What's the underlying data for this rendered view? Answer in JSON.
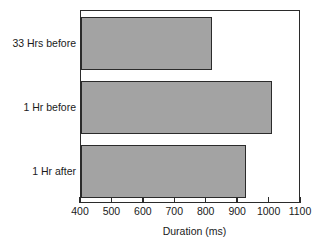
{
  "chart_data": {
    "type": "bar",
    "orientation": "horizontal",
    "title": "",
    "xlabel": "Duration (ms)",
    "ylabel": "",
    "categories": [
      "33 Hrs before",
      "1 Hr before",
      "1 Hr after"
    ],
    "values": [
      817,
      1008,
      925
    ],
    "xlim": [
      400,
      1100
    ],
    "xticks": [
      400,
      500,
      600,
      700,
      800,
      900,
      1000,
      1100
    ],
    "xtick_labels": [
      "400",
      "500",
      "600",
      "700",
      "800",
      "900",
      "1000",
      "1100"
    ],
    "grid": false,
    "legend": null,
    "series": [
      {
        "name": "Duration",
        "values": [
          817,
          1008,
          925
        ]
      }
    ],
    "bar_color": "#a3a3a3",
    "bar_edge_color": "#2b2b2b",
    "frame_color": "#2b2b2b",
    "background": "#ffffff"
  }
}
